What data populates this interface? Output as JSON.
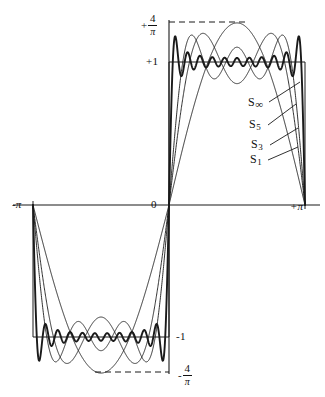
{
  "figure": {
    "background_color": "#ffffff",
    "ink_color": "#1a1a1a"
  },
  "axis_labels": {
    "x_left": "-π",
    "x_origin": "0",
    "x_right": "+π",
    "y_plus_one": "+1",
    "y_minus_one": "-1",
    "y_plus_four_over_pi_sign": "+",
    "y_plus_four_over_pi_num": "4",
    "y_plus_four_over_pi_den": "π",
    "y_minus_four_over_pi_sign": "-",
    "y_minus_four_over_pi_num": "4",
    "y_minus_four_over_pi_den": "π"
  },
  "series_legend": [
    {
      "key": "S_inf",
      "base": "S",
      "subscript": "∞",
      "label": "S∞"
    },
    {
      "key": "S_5",
      "base": "S",
      "subscript": "5",
      "label": "S5"
    },
    {
      "key": "S_3",
      "base": "S",
      "subscript": "3",
      "label": "S3"
    },
    {
      "key": "S_1",
      "base": "S",
      "subscript": "1",
      "label": "S1"
    }
  ],
  "chart_data": {
    "type": "line",
    "xlabel": "",
    "ylabel": "",
    "xlim": [
      -3.141592653589793,
      3.141592653589793
    ],
    "ylim": [
      -1.2732395447351628,
      1.2732395447351628
    ],
    "grid": false,
    "legend_position": "inside-right",
    "x_ticks": [
      {
        "value": -3.141592653589793,
        "label": "-π"
      },
      {
        "value": 0,
        "label": "0"
      },
      {
        "value": 3.141592653589793,
        "label": "+π"
      }
    ],
    "y_ticks": [
      {
        "value": 1.2732395447351628,
        "label": "+4/π"
      },
      {
        "value": 1,
        "label": "+1"
      },
      {
        "value": -1,
        "label": "-1"
      },
      {
        "value": -1.2732395447351628,
        "label": "-4/π"
      }
    ],
    "reference_lines": [
      {
        "name": "square-wave-target",
        "style": "solid",
        "values": [
          1,
          -1
        ]
      },
      {
        "name": "gibbs-overshoot-envelope",
        "style": "dashed",
        "values": [
          1.2732395447351628,
          -1.2732395447351628
        ]
      }
    ],
    "formula": "S_N(x) = (4/π) * sum_{k odd, k<=N} sin(kx)/k",
    "amplitude_scale": 1.2732395447351628,
    "series": [
      {
        "name": "S1",
        "harmonics": [
          1
        ],
        "stroke_width": 0.9,
        "peak_value": 1.2732395447351628
      },
      {
        "name": "S3",
        "harmonics": [
          1,
          3
        ],
        "stroke_width": 0.9,
        "peak_value": 1.2732395447351628
      },
      {
        "name": "S5",
        "harmonics": [
          1,
          3,
          5
        ],
        "stroke_width": 0.9,
        "peak_value": 1.2732395447351628
      },
      {
        "name": "S_inf",
        "harmonics": [
          1,
          3,
          5,
          7,
          9,
          11,
          13,
          15,
          17,
          19,
          21
        ],
        "stroke_width": 1.9,
        "peak_value": 1.2732395447351628
      }
    ]
  },
  "geometry": {
    "origin_x": 169,
    "axis_y": 205,
    "x_left_px": 33,
    "x_right_px": 305,
    "y_one_px": 62,
    "y_neg_one_px": 337,
    "y_four_over_pi_px": 22,
    "y_neg_four_over_pi_px": 372
  },
  "leader_lines": [
    {
      "for": "S_inf",
      "x1": 269,
      "y1": 102,
      "x2": 300,
      "y2": 82
    },
    {
      "for": "S_5",
      "x1": 268,
      "y1": 125,
      "x2": 296,
      "y2": 104
    },
    {
      "for": "S_3",
      "x1": 270,
      "y1": 145,
      "x2": 298,
      "y2": 128
    },
    {
      "for": "S_1",
      "x1": 268,
      "y1": 160,
      "x2": 298,
      "y2": 147
    }
  ]
}
